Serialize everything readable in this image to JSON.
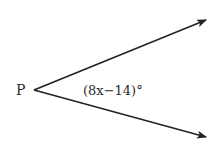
{
  "diagram": {
    "vertex_label": "P",
    "angle_label": "(8x−14)°",
    "angle_expression": {
      "coefficient": 8,
      "variable": "x",
      "constant": -14,
      "unit": "degrees"
    },
    "rays": [
      {
        "name": "upper-ray",
        "from": [
          34,
          90
        ],
        "to": [
          206,
          20
        ]
      },
      {
        "name": "lower-ray",
        "from": [
          34,
          90
        ],
        "to": [
          206,
          137
        ]
      }
    ],
    "colors": {
      "stroke": "#222222",
      "text": "#2a2a2a",
      "background": "#ffffff"
    }
  }
}
